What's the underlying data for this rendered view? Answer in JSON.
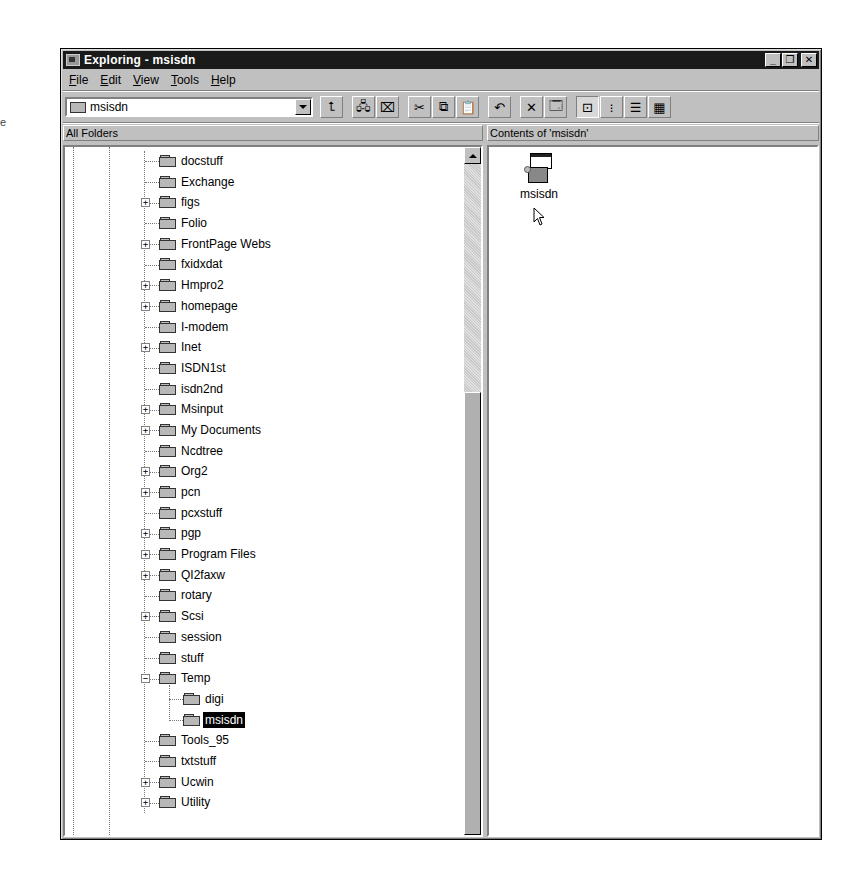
{
  "window": {
    "title": "Exploring - msisdn",
    "controls": {
      "minimize": "_",
      "maximize": "❐",
      "close": "✕"
    }
  },
  "menu": {
    "items": [
      {
        "label": "File",
        "accel": "F"
      },
      {
        "label": "Edit",
        "accel": "E"
      },
      {
        "label": "View",
        "accel": "V"
      },
      {
        "label": "Tools",
        "accel": "T"
      },
      {
        "label": "Help",
        "accel": "H"
      }
    ]
  },
  "toolbar": {
    "address_value": "msisdn",
    "buttons": [
      {
        "name": "up-one-level",
        "icon": "folder-up-icon",
        "glyph": "⮤"
      },
      {
        "name": "map-network-drive",
        "icon": "map-drive-icon",
        "glyph": "🖧"
      },
      {
        "name": "disconnect-network-drive",
        "icon": "disconnect-drive-icon",
        "glyph": "⌧"
      },
      {
        "name": "cut",
        "icon": "scissors-icon",
        "glyph": "✂"
      },
      {
        "name": "copy",
        "icon": "copy-icon",
        "glyph": "⧉"
      },
      {
        "name": "paste",
        "icon": "paste-icon",
        "glyph": "📋"
      },
      {
        "name": "undo",
        "icon": "undo-icon",
        "glyph": "↶"
      },
      {
        "name": "delete",
        "icon": "delete-icon",
        "glyph": "✕"
      },
      {
        "name": "properties",
        "icon": "properties-icon",
        "glyph": "🗔"
      },
      {
        "name": "large-icons",
        "icon": "large-icons-view-icon",
        "glyph": "⊡",
        "pressed": true
      },
      {
        "name": "small-icons",
        "icon": "small-icons-view-icon",
        "glyph": "⁝"
      },
      {
        "name": "list",
        "icon": "list-view-icon",
        "glyph": "☰"
      },
      {
        "name": "details",
        "icon": "details-view-icon",
        "glyph": "▦"
      }
    ]
  },
  "panes": {
    "left_header": "All Folders",
    "right_header": "Contents of 'msisdn'"
  },
  "tree": {
    "items": [
      {
        "label": "docstuff",
        "level": 0,
        "expander": ""
      },
      {
        "label": "Exchange",
        "level": 0,
        "expander": ""
      },
      {
        "label": "figs",
        "level": 0,
        "expander": "+"
      },
      {
        "label": "Folio",
        "level": 0,
        "expander": ""
      },
      {
        "label": "FrontPage Webs",
        "level": 0,
        "expander": "+"
      },
      {
        "label": "fxidxdat",
        "level": 0,
        "expander": ""
      },
      {
        "label": "Hmpro2",
        "level": 0,
        "expander": "+"
      },
      {
        "label": "homepage",
        "level": 0,
        "expander": "+"
      },
      {
        "label": "I-modem",
        "level": 0,
        "expander": ""
      },
      {
        "label": "Inet",
        "level": 0,
        "expander": "+"
      },
      {
        "label": "ISDN1st",
        "level": 0,
        "expander": ""
      },
      {
        "label": "isdn2nd",
        "level": 0,
        "expander": ""
      },
      {
        "label": "Msinput",
        "level": 0,
        "expander": "+"
      },
      {
        "label": "My Documents",
        "level": 0,
        "expander": "+"
      },
      {
        "label": "Ncdtree",
        "level": 0,
        "expander": ""
      },
      {
        "label": "Org2",
        "level": 0,
        "expander": "+"
      },
      {
        "label": "pcn",
        "level": 0,
        "expander": "+"
      },
      {
        "label": "pcxstuff",
        "level": 0,
        "expander": ""
      },
      {
        "label": "pgp",
        "level": 0,
        "expander": "+"
      },
      {
        "label": "Program Files",
        "level": 0,
        "expander": "+"
      },
      {
        "label": "QI2faxw",
        "level": 0,
        "expander": "+"
      },
      {
        "label": "rotary",
        "level": 0,
        "expander": ""
      },
      {
        "label": "Scsi",
        "level": 0,
        "expander": "+"
      },
      {
        "label": "session",
        "level": 0,
        "expander": ""
      },
      {
        "label": "stuff",
        "level": 0,
        "expander": ""
      },
      {
        "label": "Temp",
        "level": 0,
        "expander": "−"
      },
      {
        "label": "digi",
        "level": 1,
        "expander": ""
      },
      {
        "label": "msisdn",
        "level": 1,
        "expander": "",
        "selected": true,
        "open": true
      },
      {
        "label": "Tools_95",
        "level": 0,
        "expander": ""
      },
      {
        "label": "txtstuff",
        "level": 0,
        "expander": ""
      },
      {
        "label": "Ucwin",
        "level": 0,
        "expander": "+"
      },
      {
        "label": "Utility",
        "level": 0,
        "expander": "+"
      }
    ]
  },
  "contents": {
    "items": [
      {
        "label": "msisdn",
        "icon": "application-setup-icon"
      }
    ]
  },
  "edge_text": "e"
}
